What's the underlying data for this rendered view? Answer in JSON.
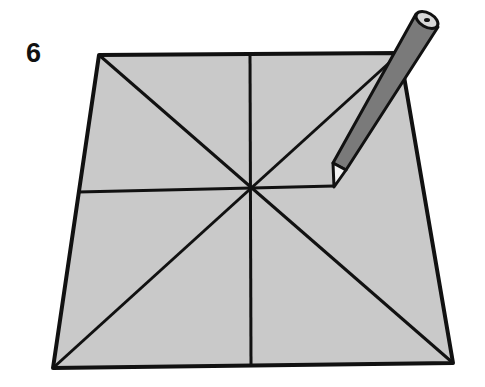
{
  "step": {
    "number": "6"
  },
  "diagram": {
    "colors": {
      "paper_fill": "#c9c9c9",
      "line": "#111111",
      "pencil_body": "#7a7a7a",
      "pencil_tip": "#f2f2f2",
      "background": "#ffffff"
    },
    "paper": {
      "corners": {
        "top_left": [
          99,
          55
        ],
        "top_right": [
          400,
          53
        ],
        "bottom_right": [
          453,
          363
        ],
        "bottom_left": [
          53,
          368
        ]
      },
      "center": [
        252,
        188
      ]
    },
    "pencil": {
      "tip": [
        334,
        186
      ],
      "end": [
        427,
        21
      ]
    }
  }
}
